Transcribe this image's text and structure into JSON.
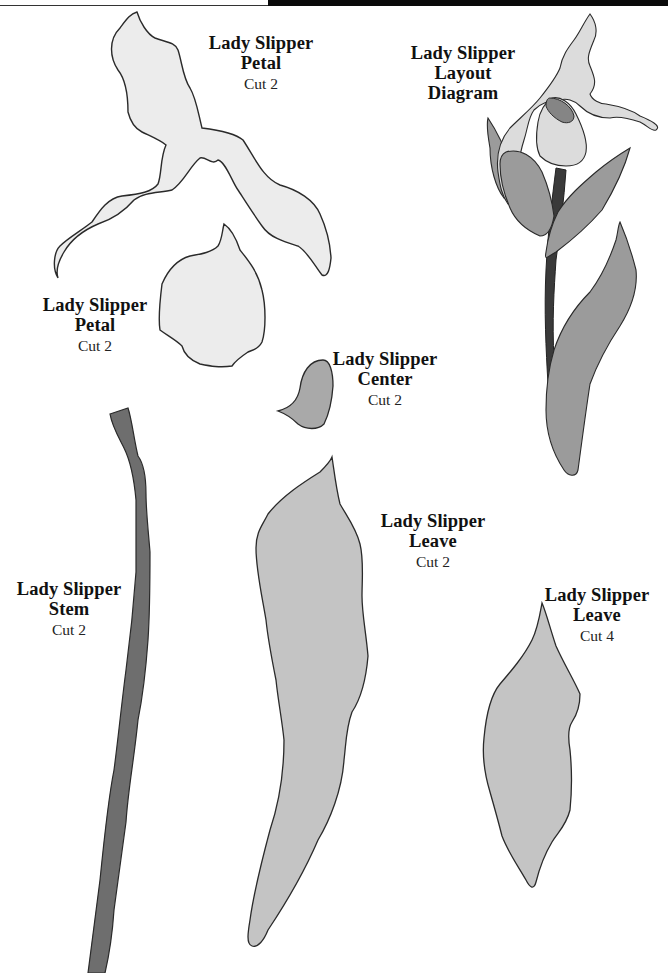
{
  "colors": {
    "petal_fill": "#ececec",
    "center_fill": "#a9a9a9",
    "leaf_fill": "#c4c4c4",
    "stem_fill": "#6e6e6e",
    "diagram_leaf_fill": "#9b9b9b",
    "diagram_stem_fill": "#3a3a3a",
    "diagram_center_fill": "#858585",
    "outline": "#2a2a2a"
  },
  "pieces": [
    {
      "id": "petal-upper",
      "title_line1": "Lady Slipper",
      "title_line2": "Petal",
      "cut": "Cut 2"
    },
    {
      "id": "petal-lower",
      "title_line1": "Lady Slipper",
      "title_line2": "Petal",
      "cut": "Cut 2"
    },
    {
      "id": "center",
      "title_line1": "Lady Slipper",
      "title_line2": "Center",
      "cut": "Cut 2"
    },
    {
      "id": "stem",
      "title_line1": "Lady Slipper",
      "title_line2": "Stem",
      "cut": "Cut 2"
    },
    {
      "id": "leave-large",
      "title_line1": "Lady Slipper",
      "title_line2": "Leave",
      "cut": "Cut 2"
    },
    {
      "id": "leave-small",
      "title_line1": "Lady Slipper",
      "title_line2": "Leave",
      "cut": "Cut 4"
    }
  ],
  "layout_diagram": {
    "title_line1": "Lady Slipper",
    "title_line2": "Layout",
    "title_line3": "Diagram"
  }
}
